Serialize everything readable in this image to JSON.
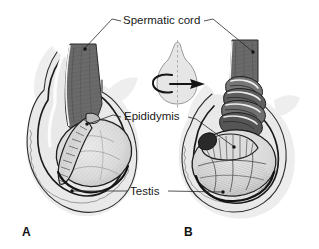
{
  "figure": {
    "background_color": "#ffffff",
    "width": 319,
    "height": 249
  },
  "labels": {
    "spermatic_cord": "Spermatic cord",
    "epididymis": "Epididymis",
    "testis": "Testis"
  },
  "panels": {
    "a": {
      "letter": "A",
      "caption": "normal anatomy",
      "cord_state": "straight"
    },
    "b": {
      "letter": "B",
      "caption": "torsion",
      "cord_state": "twisted"
    }
  },
  "inset": {
    "name": "rotation-diagram",
    "axis": "vertical dashed axis",
    "arrow_direction": "clockwise to the right"
  },
  "colors": {
    "ink": "#1a1a1a",
    "outline": "#111111",
    "cord_fill": "#6a6a6a",
    "cord_dark": "#4a4a4a",
    "cord_highlight": "#f2f2f2",
    "scrotum_fill": "#ebebeb",
    "scrotum_shadow": "#dcdcdc",
    "testis_fill": "#e2e2e2",
    "testis_shade": "#c9c9c9",
    "epididymis_fill": "#d4d4d4",
    "background": "#ffffff"
  }
}
